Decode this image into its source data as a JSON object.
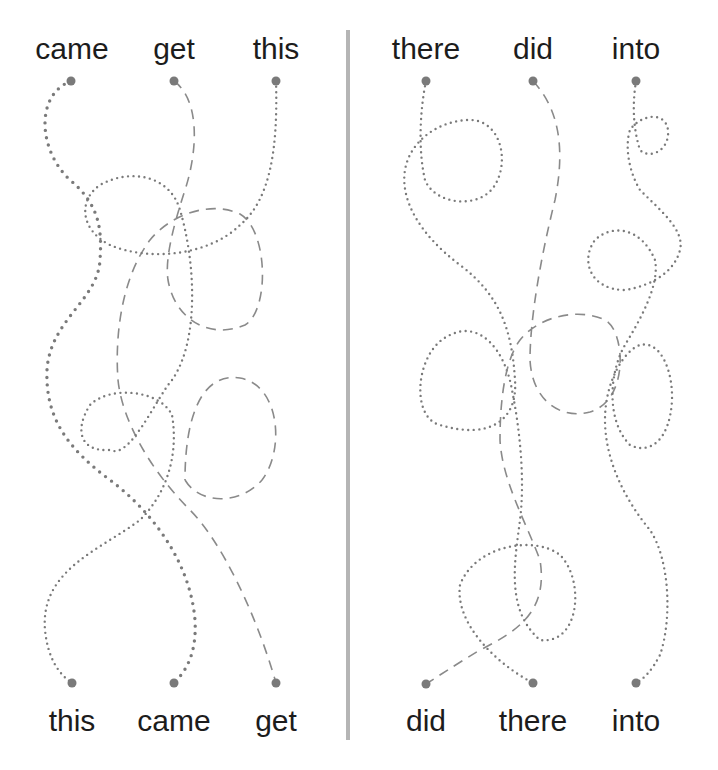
{
  "worksheet": {
    "type": "match-the-words tracing worksheet",
    "colors": {
      "text": "#1c1c1c",
      "lines": "#7a7a7a",
      "divider": "#b5b5b5",
      "background": "#ffffff"
    },
    "left_panel": {
      "top_words": [
        "came",
        "get",
        "this"
      ],
      "bottom_words": [
        "this",
        "came",
        "get"
      ],
      "paths": [
        {
          "from": "came",
          "to": "came",
          "style": "large-dotted"
        },
        {
          "from": "get",
          "to": "get",
          "style": "dashed"
        },
        {
          "from": "this",
          "to": "this",
          "style": "dotted"
        }
      ]
    },
    "right_panel": {
      "top_words": [
        "there",
        "did",
        "into"
      ],
      "bottom_words": [
        "did",
        "there",
        "into"
      ],
      "paths": [
        {
          "from": "there",
          "to": "there",
          "style": "dotted"
        },
        {
          "from": "did",
          "to": "did",
          "style": "dashed"
        },
        {
          "from": "into",
          "to": "into",
          "style": "dotted"
        }
      ]
    }
  }
}
